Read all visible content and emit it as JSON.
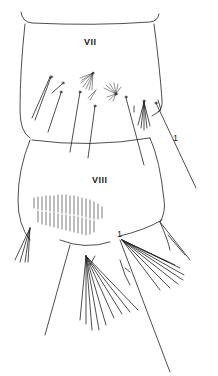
{
  "figure": {
    "segments": [
      {
        "label": "VII"
      },
      {
        "label": "VIII"
      }
    ],
    "seta_labels": [
      "1",
      "1"
    ],
    "colors": {
      "line": "#222222",
      "background": "#ffffff"
    }
  }
}
